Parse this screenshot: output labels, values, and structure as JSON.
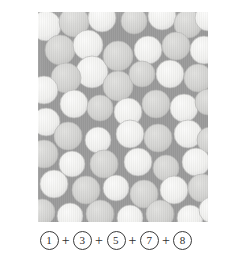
{
  "figure": {
    "panel": {
      "name": "sphere-packing-micrograph",
      "background_color": "#9b9b9b",
      "width": 170,
      "height": 210,
      "description": "Grayscale micrograph of densely packed spheres of two brightness levels on a mid-gray matrix",
      "sphere_fill_bright": "#f2f2f0",
      "sphere_fill_dim": "#d4d4d2",
      "sphere_edge_color": "#b8b8b6",
      "spheres": [
        {
          "cx": 8,
          "cy": 14,
          "r": 15,
          "shade": "bright"
        },
        {
          "cx": 36,
          "cy": 10,
          "r": 15,
          "shade": "dim"
        },
        {
          "cx": 64,
          "cy": 6,
          "r": 14,
          "shade": "bright"
        },
        {
          "cx": 96,
          "cy": 9,
          "r": 13,
          "shade": "dim"
        },
        {
          "cx": 124,
          "cy": 4,
          "r": 14,
          "shade": "bright"
        },
        {
          "cx": 150,
          "cy": 12,
          "r": 14,
          "shade": "dim"
        },
        {
          "cx": 170,
          "cy": 6,
          "r": 13,
          "shade": "bright"
        },
        {
          "cx": 22,
          "cy": 38,
          "r": 15,
          "shade": "dim"
        },
        {
          "cx": 50,
          "cy": 33,
          "r": 15,
          "shade": "bright"
        },
        {
          "cx": 54,
          "cy": 60,
          "r": 16,
          "shade": "bright"
        },
        {
          "cx": 28,
          "cy": 66,
          "r": 15,
          "shade": "dim"
        },
        {
          "cx": 80,
          "cy": 44,
          "r": 15,
          "shade": "dim"
        },
        {
          "cx": 110,
          "cy": 38,
          "r": 14,
          "shade": "bright"
        },
        {
          "cx": 138,
          "cy": 34,
          "r": 14,
          "shade": "dim"
        },
        {
          "cx": 166,
          "cy": 38,
          "r": 14,
          "shade": "bright"
        },
        {
          "cx": 6,
          "cy": 78,
          "r": 14,
          "shade": "bright"
        },
        {
          "cx": 80,
          "cy": 74,
          "r": 15,
          "shade": "dim"
        },
        {
          "cx": 104,
          "cy": 62,
          "r": 13,
          "shade": "dim"
        },
        {
          "cx": 132,
          "cy": 62,
          "r": 14,
          "shade": "bright"
        },
        {
          "cx": 160,
          "cy": 66,
          "r": 14,
          "shade": "dim"
        },
        {
          "cx": 36,
          "cy": 92,
          "r": 14,
          "shade": "bright"
        },
        {
          "cx": 62,
          "cy": 96,
          "r": 13,
          "shade": "dim"
        },
        {
          "cx": 90,
          "cy": 100,
          "r": 14,
          "shade": "bright"
        },
        {
          "cx": 118,
          "cy": 92,
          "r": 14,
          "shade": "dim"
        },
        {
          "cx": 146,
          "cy": 96,
          "r": 14,
          "shade": "bright"
        },
        {
          "cx": 170,
          "cy": 90,
          "r": 13,
          "shade": "dim"
        },
        {
          "cx": 8,
          "cy": 110,
          "r": 14,
          "shade": "bright"
        },
        {
          "cx": 30,
          "cy": 124,
          "r": 14,
          "shade": "dim"
        },
        {
          "cx": 60,
          "cy": 128,
          "r": 13,
          "shade": "bright"
        },
        {
          "cx": 92,
          "cy": 122,
          "r": 14,
          "shade": "bright"
        },
        {
          "cx": 120,
          "cy": 126,
          "r": 14,
          "shade": "dim"
        },
        {
          "cx": 150,
          "cy": 122,
          "r": 14,
          "shade": "bright"
        },
        {
          "cx": 172,
          "cy": 128,
          "r": 13,
          "shade": "dim"
        },
        {
          "cx": 6,
          "cy": 142,
          "r": 14,
          "shade": "dim"
        },
        {
          "cx": 34,
          "cy": 152,
          "r": 13,
          "shade": "bright"
        },
        {
          "cx": 66,
          "cy": 152,
          "r": 14,
          "shade": "dim"
        },
        {
          "cx": 100,
          "cy": 150,
          "r": 14,
          "shade": "bright"
        },
        {
          "cx": 128,
          "cy": 156,
          "r": 13,
          "shade": "dim"
        },
        {
          "cx": 158,
          "cy": 150,
          "r": 14,
          "shade": "bright"
        },
        {
          "cx": 16,
          "cy": 172,
          "r": 14,
          "shade": "bright"
        },
        {
          "cx": 48,
          "cy": 178,
          "r": 14,
          "shade": "dim"
        },
        {
          "cx": 78,
          "cy": 176,
          "r": 13,
          "shade": "bright"
        },
        {
          "cx": 106,
          "cy": 182,
          "r": 14,
          "shade": "dim"
        },
        {
          "cx": 136,
          "cy": 178,
          "r": 14,
          "shade": "bright"
        },
        {
          "cx": 164,
          "cy": 176,
          "r": 14,
          "shade": "dim"
        },
        {
          "cx": 4,
          "cy": 200,
          "r": 13,
          "shade": "dim"
        },
        {
          "cx": 32,
          "cy": 204,
          "r": 13,
          "shade": "bright"
        },
        {
          "cx": 62,
          "cy": 202,
          "r": 14,
          "shade": "dim"
        },
        {
          "cx": 92,
          "cy": 206,
          "r": 13,
          "shade": "bright"
        },
        {
          "cx": 122,
          "cy": 202,
          "r": 14,
          "shade": "dim"
        },
        {
          "cx": 152,
          "cy": 206,
          "r": 13,
          "shade": "bright"
        },
        {
          "cx": 174,
          "cy": 198,
          "r": 13,
          "shade": "bright"
        }
      ]
    },
    "caption": {
      "name": "equation-caption",
      "text": "① + ③ + ⑤ + ⑦ + ⑧",
      "terms": [
        "1",
        "3",
        "5",
        "7",
        "8"
      ],
      "operator": "+",
      "term_style": "circled-number"
    }
  }
}
